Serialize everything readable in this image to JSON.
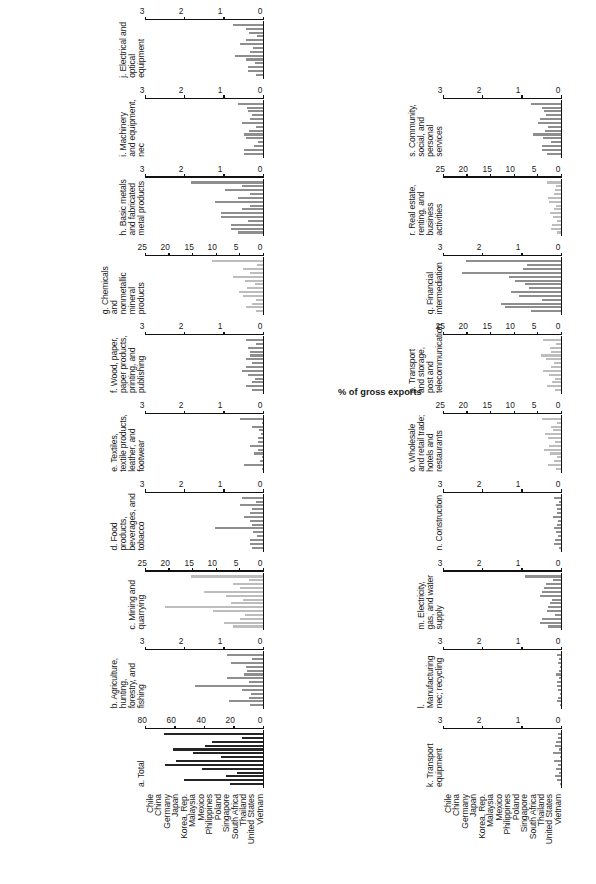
{
  "figure": {
    "axis_caption": "% of gross exports",
    "countries": [
      "Chile",
      "China",
      "Germany",
      "Japan",
      "Korea, Rep.",
      "Malaysia",
      "Mexico",
      "Philippines",
      "Poland",
      "Singapore",
      "South Africa",
      "Thailand",
      "United States",
      "Vietnam"
    ]
  },
  "chart_data": [
    {
      "type": "bar",
      "id": "a",
      "title": "a. Total",
      "shade": "dark",
      "categories": [
        "Chile",
        "China",
        "Germany",
        "Japan",
        "Korea, Rep.",
        "Malaysia",
        "Mexico",
        "Philippines",
        "Poland",
        "Singapore",
        "South Africa",
        "Thailand",
        "United States",
        "Vietnam"
      ],
      "values": [
        23,
        54,
        26,
        18,
        42,
        67,
        60,
        29,
        48,
        62,
        40,
        35,
        15,
        68
      ],
      "xlabel": "",
      "ylabel": "% of gross exports",
      "ylim": [
        0,
        80
      ],
      "yticks": [
        0,
        20,
        40,
        60,
        80
      ],
      "ytick_labels": [
        "0",
        "20",
        "40",
        "60",
        "80"
      ]
    },
    {
      "type": "bar",
      "id": "b",
      "title": "b. Agriculture, hunting, forestry, and fishing",
      "shade": "mid",
      "categories": [
        "Chile",
        "China",
        "Germany",
        "Japan",
        "Korea, Rep.",
        "Malaysia",
        "Mexico",
        "Philippines",
        "Poland",
        "Singapore",
        "South Africa",
        "Thailand",
        "United States",
        "Vietnam"
      ],
      "values": [
        0.35,
        0.9,
        0.38,
        0.33,
        0.55,
        1.75,
        0.38,
        0.95,
        0.5,
        0.42,
        0.45,
        0.85,
        0.3,
        0.95
      ],
      "xlabel": "",
      "ylabel": "% of gross exports",
      "ylim": [
        0,
        3
      ],
      "yticks": [
        0,
        1,
        2,
        3
      ],
      "ytick_labels": [
        "0",
        "1",
        "2",
        "3"
      ]
    },
    {
      "type": "bar",
      "id": "c",
      "title": "c. Mining and quarrying",
      "shade": "light",
      "categories": [
        "Chile",
        "China",
        "Germany",
        "Japan",
        "Korea, Rep.",
        "Malaysia",
        "Mexico",
        "Philippines",
        "Poland",
        "Singapore",
        "South Africa",
        "Thailand",
        "United States",
        "Vietnam"
      ],
      "values": [
        6.5,
        8.5,
        5.0,
        4.0,
        10.8,
        21.0,
        7.0,
        4.5,
        8.0,
        12.8,
        5.0,
        6.5,
        3.2,
        15.5
      ],
      "xlabel": "",
      "ylabel": "% of gross exports",
      "ylim": [
        0,
        25
      ],
      "yticks": [
        0,
        5,
        10,
        15,
        20,
        25
      ],
      "ytick_labels": [
        "0",
        "5",
        "10",
        "15",
        "20",
        "25"
      ]
    },
    {
      "type": "bar",
      "id": "d",
      "title": "d. Food products, beverages, and tobacco",
      "shade": "mid",
      "categories": [
        "Chile",
        "China",
        "Germany",
        "Japan",
        "Korea, Rep.",
        "Malaysia",
        "Mexico",
        "Philippines",
        "Poland",
        "Singapore",
        "South Africa",
        "Thailand",
        "United States",
        "Vietnam"
      ],
      "values": [
        0.3,
        0.35,
        0.35,
        0.18,
        0.28,
        1.25,
        0.3,
        0.35,
        0.5,
        0.35,
        0.3,
        0.6,
        0.2,
        0.55
      ],
      "xlabel": "",
      "ylabel": "% of gross exports",
      "ylim": [
        0,
        3
      ],
      "yticks": [
        0,
        1,
        2,
        3
      ],
      "ytick_labels": [
        "0",
        "1",
        "2",
        "3"
      ]
    },
    {
      "type": "bar",
      "id": "e",
      "title": "e. Textiles, textile products, leather, and footwear",
      "shade": "mid",
      "categories": [
        "Chile",
        "China",
        "Germany",
        "Japan",
        "Korea, Rep.",
        "Malaysia",
        "Mexico",
        "Philippines",
        "Poland",
        "Singapore",
        "South Africa",
        "Thailand",
        "United States",
        "Vietnam"
      ],
      "values": [
        0.05,
        0.5,
        0.1,
        0.05,
        0.25,
        0.15,
        0.35,
        0.15,
        0.15,
        0.07,
        0.12,
        0.3,
        0.05,
        0.6
      ],
      "xlabel": "",
      "ylabel": "% of gross exports",
      "ylim": [
        0,
        3
      ],
      "yticks": [
        0,
        1,
        2,
        3
      ],
      "ytick_labels": [
        "0",
        "1",
        "2",
        "3"
      ]
    },
    {
      "type": "bar",
      "id": "f",
      "title": "f. Wood, paper, paper products, printing, and publishing",
      "shade": "mid",
      "categories": [
        "Chile",
        "China",
        "Germany",
        "Japan",
        "Korea, Rep.",
        "Malaysia",
        "Mexico",
        "Philippines",
        "Poland",
        "Singapore",
        "South Africa",
        "Thailand",
        "United States",
        "Vietnam"
      ],
      "values": [
        0.3,
        0.45,
        0.3,
        0.22,
        0.4,
        0.55,
        0.45,
        0.3,
        0.45,
        0.35,
        0.35,
        0.4,
        0.2,
        0.45
      ],
      "xlabel": "",
      "ylabel": "% of gross exports",
      "ylim": [
        0,
        3
      ],
      "yticks": [
        0,
        1,
        2,
        3
      ],
      "ytick_labels": [
        "0",
        "1",
        "2",
        "3"
      ]
    },
    {
      "type": "bar",
      "id": "g",
      "title": "g. Chemicals and nonmetallic mineral products",
      "shade": "light",
      "categories": [
        "Chile",
        "China",
        "Germany",
        "Japan",
        "Korea, Rep.",
        "Malaysia",
        "Mexico",
        "Philippines",
        "Poland",
        "Singapore",
        "South Africa",
        "Thailand",
        "United States",
        "Vietnam"
      ],
      "values": [
        1.8,
        3.8,
        2.5,
        1.6,
        4.5,
        5.2,
        3.5,
        2.0,
        4.0,
        6.5,
        3.0,
        4.5,
        1.5,
        11.0
      ],
      "xlabel": "",
      "ylabel": "% of gross exports",
      "ylim": [
        0,
        25
      ],
      "yticks": [
        0,
        5,
        10,
        15,
        20,
        25
      ],
      "ytick_labels": [
        "0",
        "5",
        "10",
        "15",
        "20",
        "25"
      ]
    },
    {
      "type": "bar",
      "id": "h",
      "title": "h. Basic metals and fabricated metal products",
      "shade": "mid",
      "categories": [
        "Chile",
        "China",
        "Germany",
        "Japan",
        "Korea, Rep.",
        "Malaysia",
        "Mexico",
        "Philippines",
        "Poland",
        "Singapore",
        "South Africa",
        "Thailand",
        "United States",
        "Vietnam"
      ],
      "values": [
        0.65,
        0.85,
        0.85,
        0.4,
        1.1,
        1.1,
        0.55,
        0.35,
        1.25,
        0.65,
        0.35,
        1.0,
        0.55,
        1.85
      ],
      "xlabel": "",
      "ylabel": "% of gross exports",
      "ylim": [
        0,
        3
      ],
      "yticks": [
        0,
        1,
        2,
        3
      ],
      "ytick_labels": [
        "0",
        "1",
        "2",
        "3"
      ]
    },
    {
      "type": "bar",
      "id": "i",
      "title": "i. Machinery and equipment, nec",
      "shade": "mid",
      "categories": [
        "Chile",
        "China",
        "Germany",
        "Japan",
        "Korea, Rep.",
        "Malaysia",
        "Mexico",
        "Philippines",
        "Poland",
        "Singapore",
        "South Africa",
        "Thailand",
        "United States",
        "Vietnam"
      ],
      "values": [
        0.52,
        0.5,
        0.25,
        0.15,
        0.45,
        0.5,
        0.38,
        0.2,
        0.55,
        0.35,
        0.3,
        0.4,
        0.42,
        0.65
      ],
      "xlabel": "",
      "ylabel": "% of gross exports",
      "ylim": [
        0,
        3
      ],
      "yticks": [
        0,
        1,
        2,
        3
      ],
      "ytick_labels": [
        "0",
        "1",
        "2",
        "3"
      ]
    },
    {
      "type": "bar",
      "id": "j",
      "title": "j. Electrical and optical equipment",
      "shade": "mid",
      "categories": [
        "Chile",
        "China",
        "Germany",
        "Japan",
        "Korea, Rep.",
        "Malaysia",
        "Mexico",
        "Philippines",
        "Poland",
        "Singapore",
        "South Africa",
        "Thailand",
        "United States",
        "Vietnam"
      ],
      "values": [
        0.2,
        0.4,
        0.4,
        0.22,
        0.45,
        0.75,
        0.35,
        0.28,
        0.6,
        0.45,
        0.18,
        0.38,
        0.45,
        0.78
      ],
      "xlabel": "",
      "ylabel": "% of gross exports",
      "ylim": [
        0,
        3
      ],
      "yticks": [
        0,
        1,
        2,
        3
      ],
      "ytick_labels": [
        "0",
        "1",
        "2",
        "3"
      ]
    },
    {
      "type": "bar",
      "id": "k",
      "title": "k. Transport equipment",
      "shade": "mid",
      "categories": [
        "Chile",
        "China",
        "Germany",
        "Japan",
        "Korea, Rep.",
        "Malaysia",
        "Mexico",
        "Philippines",
        "Poland",
        "Singapore",
        "South Africa",
        "Thailand",
        "United States",
        "Vietnam"
      ],
      "values": [
        0.05,
        0.12,
        0.18,
        0.08,
        0.15,
        0.1,
        0.2,
        0.06,
        0.22,
        0.07,
        0.18,
        0.15,
        0.1,
        0.1
      ],
      "xlabel": "",
      "ylabel": "% of gross exports",
      "ylim": [
        0,
        3
      ],
      "yticks": [
        0,
        1,
        2,
        3
      ],
      "ytick_labels": [
        "0",
        "1",
        "2",
        "3"
      ]
    },
    {
      "type": "bar",
      "id": "l",
      "title": "l. Manufacturing nec; recycling",
      "shade": "mid",
      "categories": [
        "Chile",
        "China",
        "Germany",
        "Japan",
        "Korea, Rep.",
        "Malaysia",
        "Mexico",
        "Philippines",
        "Poland",
        "Singapore",
        "South Africa",
        "Thailand",
        "United States",
        "Vietnam"
      ],
      "values": [
        0.05,
        0.12,
        0.1,
        0.05,
        0.1,
        0.12,
        0.12,
        0.07,
        0.15,
        0.08,
        0.06,
        0.1,
        0.07,
        0.12
      ],
      "xlabel": "",
      "ylabel": "% of gross exports",
      "ylim": [
        0,
        3
      ],
      "yticks": [
        0,
        1,
        2,
        3
      ],
      "ytick_labels": [
        "0",
        "1",
        "2",
        "3"
      ]
    },
    {
      "type": "bar",
      "id": "m",
      "title": "m. Electricity, gas, and water supply",
      "shade": "mid",
      "categories": [
        "Chile",
        "China",
        "Germany",
        "Japan",
        "Korea, Rep.",
        "Malaysia",
        "Mexico",
        "Philippines",
        "Poland",
        "Singapore",
        "South Africa",
        "Thailand",
        "United States",
        "Vietnam"
      ],
      "values": [
        0.35,
        0.55,
        0.5,
        0.18,
        0.38,
        0.35,
        0.3,
        0.25,
        0.55,
        0.5,
        0.45,
        0.4,
        0.22,
        0.95
      ],
      "xlabel": "",
      "ylabel": "% of gross exports",
      "ylim": [
        0,
        3
      ],
      "yticks": [
        0,
        1,
        2,
        3
      ],
      "ytick_labels": [
        "0",
        "1",
        "2",
        "3"
      ]
    },
    {
      "type": "bar",
      "id": "n",
      "title": "n. Construction",
      "shade": "mid",
      "categories": [
        "Chile",
        "China",
        "Germany",
        "Japan",
        "Korea, Rep.",
        "Malaysia",
        "Mexico",
        "Philippines",
        "Poland",
        "Singapore",
        "South Africa",
        "Thailand",
        "United States",
        "Vietnam"
      ],
      "values": [
        0.08,
        0.2,
        0.18,
        0.1,
        0.15,
        0.2,
        0.12,
        0.1,
        0.22,
        0.12,
        0.12,
        0.15,
        0.08,
        0.2
      ],
      "xlabel": "",
      "ylabel": "% of gross exports",
      "ylim": [
        0,
        3
      ],
      "yticks": [
        0,
        1,
        2,
        3
      ],
      "ytick_labels": [
        "0",
        "1",
        "2",
        "3"
      ]
    },
    {
      "type": "bar",
      "id": "o",
      "title": "o. Wholesale and retail trade; hotels and restaurants",
      "shade": "light",
      "categories": [
        "Chile",
        "China",
        "Germany",
        "Japan",
        "Korea, Rep.",
        "Malaysia",
        "Mexico",
        "Philippines",
        "Poland",
        "Singapore",
        "South Africa",
        "Thailand",
        "United States",
        "Vietnam"
      ],
      "values": [
        1.2,
        3.0,
        1.6,
        1.1,
        2.5,
        3.8,
        2.8,
        1.5,
        3.0,
        3.5,
        2.0,
        2.3,
        1.0,
        4.2
      ],
      "xlabel": "",
      "ylabel": "% of gross exports",
      "ylim": [
        0,
        25
      ],
      "yticks": [
        0,
        5,
        10,
        15,
        20,
        25
      ],
      "ytick_labels": [
        "0",
        "5",
        "10",
        "15",
        "20",
        "25"
      ]
    },
    {
      "type": "bar",
      "id": "p",
      "title": "p. Transport and storage, post and telecommunication",
      "shade": "light",
      "categories": [
        "Chile",
        "China",
        "Germany",
        "Japan",
        "Korea, Rep.",
        "Malaysia",
        "Mexico",
        "Philippines",
        "Poland",
        "Singapore",
        "South Africa",
        "Thailand",
        "United States",
        "Vietnam"
      ],
      "values": [
        1.5,
        3.2,
        2.2,
        1.4,
        2.8,
        4.0,
        2.4,
        1.8,
        3.3,
        4.5,
        2.4,
        2.6,
        1.2,
        4.0
      ],
      "xlabel": "",
      "ylabel": "% of gross exports",
      "ylim": [
        0,
        25
      ],
      "yticks": [
        0,
        5,
        10,
        15,
        20,
        25
      ],
      "ytick_labels": [
        "0",
        "5",
        "10",
        "15",
        "20",
        "25"
      ]
    },
    {
      "type": "bar",
      "id": "q",
      "title": "q. Financial intermediation",
      "shade": "mid",
      "categories": [
        "Chile",
        "China",
        "Germany",
        "Japan",
        "Korea, Rep.",
        "Malaysia",
        "Mexico",
        "Philippines",
        "Poland",
        "Singapore",
        "South Africa",
        "Thailand",
        "United States",
        "Vietnam"
      ],
      "values": [
        0.8,
        1.45,
        1.55,
        0.5,
        1.1,
        1.3,
        0.85,
        0.95,
        1.2,
        1.35,
        2.55,
        1.0,
        0.9,
        2.45
      ],
      "xlabel": "",
      "ylabel": "% of gross exports",
      "ylim": [
        0,
        3
      ],
      "yticks": [
        0,
        1,
        2,
        3
      ],
      "ytick_labels": [
        "0",
        "1",
        "2",
        "3"
      ]
    },
    {
      "type": "bar",
      "id": "r",
      "title": "r. Real estate, renting, and business activities",
      "shade": "light",
      "categories": [
        "Chile",
        "China",
        "Germany",
        "Japan",
        "Korea, Rep.",
        "Malaysia",
        "Mexico",
        "Philippines",
        "Poland",
        "Singapore",
        "South Africa",
        "Thailand",
        "United States",
        "Vietnam"
      ],
      "values": [
        1.0,
        2.4,
        2.2,
        1.0,
        2.0,
        2.6,
        1.8,
        1.3,
        2.8,
        3.0,
        1.6,
        1.5,
        1.2,
        3.2
      ],
      "xlabel": "",
      "ylabel": "% of gross exports",
      "ylim": [
        0,
        25
      ],
      "yticks": [
        0,
        5,
        10,
        15,
        20,
        25
      ],
      "ytick_labels": [
        "0",
        "5",
        "10",
        "15",
        "20",
        "25"
      ]
    },
    {
      "type": "bar",
      "id": "s",
      "title": "s. Community, social, and personal services",
      "shade": "mid",
      "categories": [
        "Chile",
        "China",
        "Germany",
        "Japan",
        "Korea, Rep.",
        "Malaysia",
        "Mexico",
        "Philippines",
        "Poland",
        "Singapore",
        "South Africa",
        "Thailand",
        "United States",
        "Vietnam"
      ],
      "values": [
        0.38,
        0.5,
        0.5,
        0.28,
        0.48,
        0.75,
        0.42,
        0.35,
        0.62,
        0.55,
        0.4,
        0.45,
        0.52,
        0.78
      ],
      "xlabel": "",
      "ylabel": "% of gross exports",
      "ylim": [
        0,
        3
      ],
      "yticks": [
        0,
        1,
        2,
        3
      ],
      "ytick_labels": [
        "0",
        "1",
        "2",
        "3"
      ]
    }
  ]
}
